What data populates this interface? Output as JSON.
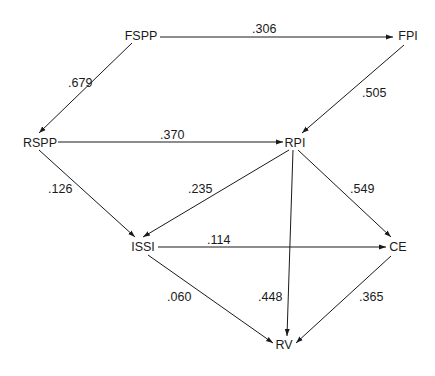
{
  "diagram": {
    "type": "path-diagram",
    "nodes": [
      {
        "id": "FSPP",
        "label": "FSPP",
        "x": 141,
        "y": 36
      },
      {
        "id": "FPI",
        "label": "FPI",
        "x": 408,
        "y": 36
      },
      {
        "id": "RSPP",
        "label": "RSPP",
        "x": 40,
        "y": 143
      },
      {
        "id": "RPI",
        "label": "RPI",
        "x": 295,
        "y": 143
      },
      {
        "id": "ISSI",
        "label": "ISSI",
        "x": 143,
        "y": 247
      },
      {
        "id": "CE",
        "label": "CE",
        "x": 398,
        "y": 247
      },
      {
        "id": "RV",
        "label": "RV",
        "x": 284,
        "y": 345
      }
    ],
    "edges": [
      {
        "from": "FSPP",
        "to": "FPI",
        "label": ".306",
        "x1": 160,
        "y1": 37,
        "x2": 393,
        "y2": 37,
        "lx": 252,
        "ly": 33
      },
      {
        "from": "FSPP",
        "to": "RSPP",
        "label": ".679",
        "x1": 132,
        "y1": 43,
        "x2": 39,
        "y2": 133,
        "lx": 68,
        "ly": 87
      },
      {
        "from": "FPI",
        "to": "RPI",
        "label": ".505",
        "x1": 404,
        "y1": 45,
        "x2": 302,
        "y2": 133,
        "lx": 362,
        "ly": 97
      },
      {
        "from": "RSPP",
        "to": "RPI",
        "label": ".370",
        "x1": 58,
        "y1": 142,
        "x2": 283,
        "y2": 142,
        "lx": 160,
        "ly": 139
      },
      {
        "from": "RSPP",
        "to": "ISSI",
        "label": ".126",
        "x1": 39,
        "y1": 150,
        "x2": 135,
        "y2": 237,
        "lx": 48,
        "ly": 193
      },
      {
        "from": "RPI",
        "to": "ISSI",
        "label": ".235",
        "x1": 289,
        "y1": 150,
        "x2": 143,
        "y2": 237,
        "lx": 188,
        "ly": 193
      },
      {
        "from": "RPI",
        "to": "CE",
        "label": ".549",
        "x1": 298,
        "y1": 150,
        "x2": 391,
        "y2": 237,
        "lx": 350,
        "ly": 193
      },
      {
        "from": "RPI",
        "to": "RV",
        "label": ".448",
        "x1": 293,
        "y1": 150,
        "x2": 287,
        "y2": 336,
        "lx": 258,
        "ly": 301
      },
      {
        "from": "ISSI",
        "to": "CE",
        "label": ".114",
        "x1": 158,
        "y1": 247,
        "x2": 386,
        "y2": 247,
        "lx": 207,
        "ly": 244
      },
      {
        "from": "ISSI",
        "to": "RV",
        "label": ".060",
        "x1": 148,
        "y1": 255,
        "x2": 273,
        "y2": 343,
        "lx": 167,
        "ly": 301
      },
      {
        "from": "CE",
        "to": "RV",
        "label": ".365",
        "x1": 391,
        "y1": 256,
        "x2": 296,
        "y2": 343,
        "lx": 359,
        "ly": 301
      }
    ]
  }
}
